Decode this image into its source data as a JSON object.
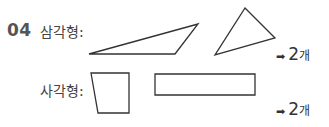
{
  "problem": {
    "number": "04",
    "triangle": {
      "label": "삼각형:",
      "answer_arrow": "➡",
      "answer_count": "2",
      "answer_unit": "개",
      "shapes": [
        {
          "type": "triangle",
          "points": "89,54 198,24 175,54"
        },
        {
          "type": "triangle",
          "points": "245,8 275,38 215,55"
        }
      ]
    },
    "quadrilateral": {
      "label": "사각형:",
      "answer_arrow": "➡",
      "answer_count": "2",
      "answer_unit": "개",
      "shapes": [
        {
          "type": "quadrilateral",
          "points": "91,73 129,73 129,113 98,113"
        },
        {
          "type": "rectangle",
          "points": "155,74 255,74 255,95 155,95"
        }
      ]
    }
  },
  "colors": {
    "stroke": "#333333",
    "number": "#555555"
  }
}
